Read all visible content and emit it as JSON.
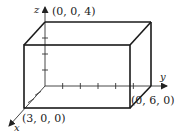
{
  "diagram": {
    "axes": {
      "x_label": "x",
      "y_label": "y",
      "z_label": "z"
    },
    "box_dimensions": {
      "x": 3,
      "y": 6,
      "z": 4
    },
    "vertex_labels": {
      "z_vertex": "(0, 0, 4)",
      "x_vertex": "(3, 0, 0)",
      "y_vertex": "(0, 6, 0)"
    },
    "colors": {
      "edge": "#1a1a1a",
      "axis": "#333333",
      "background": "#ffffff"
    }
  }
}
